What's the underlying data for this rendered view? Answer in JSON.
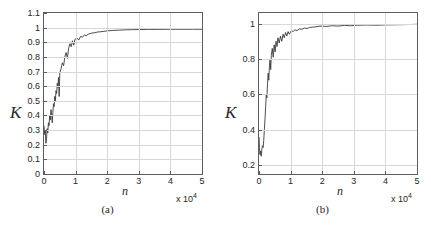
{
  "figure": {
    "background_color": "#ffffff",
    "curve_color": "#3a3a3a",
    "grid_color": "#d8d8d8",
    "axis_color": "#5d5d5d",
    "bottom_text": ""
  },
  "chart_data": [
    {
      "type": "line",
      "panel_label": "(a)",
      "title": "",
      "xlabel": "n",
      "ylabel": "K",
      "x_multiplier": "x 10",
      "x_multiplier_exp": "4",
      "xlim": [
        0,
        50000
      ],
      "ylim": [
        0,
        1.1
      ],
      "xticks": [
        0,
        10000,
        20000,
        30000,
        40000,
        50000
      ],
      "xticklabels": [
        "0",
        "1",
        "2",
        "3",
        "4",
        "5"
      ],
      "yticks": [
        0,
        0.1,
        0.2,
        0.3,
        0.4,
        0.5,
        0.6,
        0.7,
        0.8,
        0.9,
        1,
        1.1
      ],
      "yticklabels": [
        "0",
        "0.1",
        "0.2",
        "0.3",
        "0.4",
        "0.5",
        "0.6",
        "0.7",
        "0.8",
        "0.9",
        "1",
        "1.1"
      ],
      "grid": true,
      "legend": "none",
      "series": [
        {
          "name": "K",
          "x": [
            0,
            200,
            400,
            600,
            800,
            1000,
            1200,
            1400,
            1600,
            1800,
            2000,
            2200,
            2400,
            2600,
            2800,
            3000,
            3200,
            3400,
            3600,
            3800,
            4000,
            4200,
            4400,
            4600,
            4800,
            5000,
            5400,
            5800,
            6200,
            6600,
            7000,
            7400,
            7800,
            8200,
            8600,
            9000,
            9400,
            9800,
            10400,
            11000,
            11600,
            12200,
            12800,
            13400,
            14000,
            15000,
            16000,
            17000,
            18000,
            19000,
            20000,
            22000,
            24000,
            26000,
            28000,
            30000,
            33000,
            36000,
            40000,
            44000,
            47000,
            50000
          ],
          "y": [
            0.33,
            0.27,
            0.3,
            0.21,
            0.24,
            0.31,
            0.28,
            0.35,
            0.33,
            0.4,
            0.37,
            0.44,
            0.41,
            0.35,
            0.42,
            0.48,
            0.46,
            0.53,
            0.5,
            0.57,
            0.55,
            0.62,
            0.59,
            0.66,
            0.53,
            0.69,
            0.72,
            0.76,
            0.74,
            0.8,
            0.83,
            0.79,
            0.86,
            0.89,
            0.87,
            0.91,
            0.88,
            0.92,
            0.93,
            0.915,
            0.94,
            0.935,
            0.95,
            0.945,
            0.955,
            0.962,
            0.966,
            0.97,
            0.972,
            0.975,
            0.978,
            0.981,
            0.983,
            0.985,
            0.986,
            0.987,
            0.988,
            0.988,
            0.989,
            0.989,
            0.989,
            0.989
          ]
        }
      ]
    },
    {
      "type": "line",
      "panel_label": "(b)",
      "title": "",
      "xlabel": "n",
      "ylabel": "K",
      "x_multiplier": "x 10",
      "x_multiplier_exp": "4",
      "xlim": [
        0,
        50000
      ],
      "ylim": [
        0.15,
        1.06
      ],
      "xticks": [
        0,
        10000,
        20000,
        30000,
        40000,
        50000
      ],
      "xticklabels": [
        "0",
        "1",
        "2",
        "3",
        "4",
        "5"
      ],
      "yticks": [
        0.2,
        0.4,
        0.6,
        0.8,
        1
      ],
      "yticklabels": [
        "0.2",
        "0.4",
        "0.6",
        "0.8",
        "1"
      ],
      "grid": true,
      "legend": "none",
      "series": [
        {
          "name": "K",
          "x": [
            0,
            150,
            300,
            500,
            700,
            900,
            1100,
            1300,
            1500,
            1700,
            1900,
            2100,
            2300,
            2500,
            2700,
            2900,
            3100,
            3300,
            3500,
            3700,
            3900,
            4200,
            4500,
            4800,
            5100,
            5400,
            5700,
            6000,
            6400,
            6800,
            7200,
            7600,
            8000,
            8400,
            8800,
            9200,
            9600,
            10200,
            10800,
            11400,
            12000,
            12800,
            13600,
            14400,
            15200,
            16000,
            17000,
            18000,
            19000,
            20000,
            21500,
            23000,
            25000,
            27000,
            29000,
            31000,
            34000,
            37000,
            41000,
            45000,
            48000,
            50000
          ],
          "y": [
            0.36,
            0.3,
            0.26,
            0.28,
            0.25,
            0.29,
            0.31,
            0.3,
            0.34,
            0.4,
            0.46,
            0.53,
            0.6,
            0.58,
            0.66,
            0.72,
            0.68,
            0.76,
            0.8,
            0.74,
            0.82,
            0.86,
            0.81,
            0.88,
            0.84,
            0.9,
            0.87,
            0.92,
            0.89,
            0.93,
            0.9,
            0.94,
            0.92,
            0.95,
            0.93,
            0.955,
            0.94,
            0.96,
            0.955,
            0.965,
            0.96,
            0.97,
            0.968,
            0.975,
            0.972,
            0.978,
            0.98,
            0.982,
            0.985,
            0.986,
            0.984,
            0.988,
            0.986,
            0.99,
            0.988,
            0.991,
            0.992,
            0.991,
            0.993,
            0.994,
            0.995,
            0.996
          ]
        }
      ]
    }
  ]
}
